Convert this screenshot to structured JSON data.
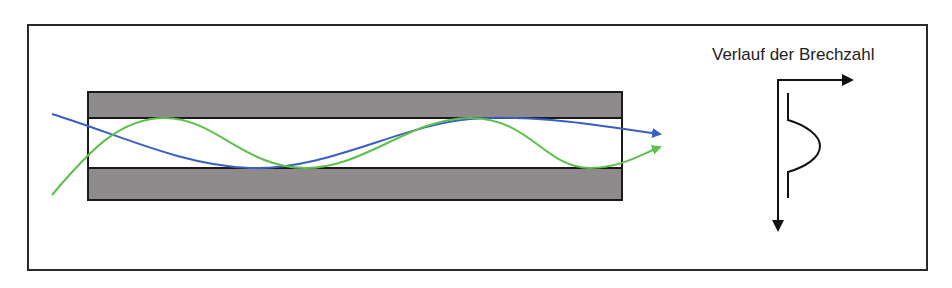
{
  "diagram": {
    "profile_title": "Verlauf der Brechzahl",
    "colors": {
      "cladding": "#8f8a8c",
      "core": "#ffffff",
      "outline": "#1a1a1a",
      "ray_blue": "#3a5fc4",
      "ray_green": "#5cc04a",
      "axis": "#111111"
    },
    "elements": {
      "fiber": "graded-index-fiber",
      "rays": [
        "blue-ray",
        "green-ray"
      ],
      "profile": "refractive-index-profile"
    }
  }
}
